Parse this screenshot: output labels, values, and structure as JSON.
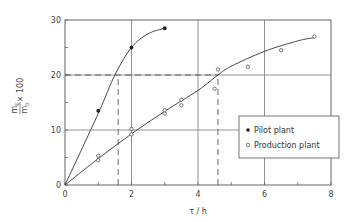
{
  "chart_data": {
    "type": "scatter",
    "title": "",
    "xlabel": "τ / h",
    "ylabel_numerator": "m_E",
    "ylabel_denominator": "m_0",
    "ylabel_suffix": "× 100",
    "ylabel": "m_E / m_0 × 100",
    "xlim": [
      0,
      8
    ],
    "ylim": [
      0,
      30
    ],
    "x_ticks": [
      0,
      2,
      4,
      6,
      8
    ],
    "y_ticks": [
      0,
      10,
      20,
      30
    ],
    "x_tick_labels": [
      "0",
      "2",
      "4",
      "6",
      "8"
    ],
    "y_tick_labels": [
      "0",
      "10",
      "20",
      "30"
    ],
    "grid": true,
    "legend_position": "right-center inside plot",
    "series": [
      {
        "name": "Pilot plant",
        "marker": "filled-circle",
        "points": [
          [
            0,
            0
          ],
          [
            1,
            13.5
          ],
          [
            2,
            25
          ],
          [
            3,
            28.5
          ]
        ],
        "curve": [
          [
            0,
            0
          ],
          [
            1,
            13
          ],
          [
            1.5,
            20
          ],
          [
            2,
            25
          ],
          [
            2.5,
            27.5
          ],
          [
            3,
            28.5
          ]
        ]
      },
      {
        "name": "Production plant",
        "marker": "open-circle",
        "points": [
          [
            0,
            0
          ],
          [
            1,
            4.5
          ],
          [
            1,
            5.3
          ],
          [
            2,
            9.2
          ],
          [
            2,
            10.2
          ],
          [
            3,
            13
          ],
          [
            3,
            13.6
          ],
          [
            3.5,
            14.5
          ],
          [
            3.5,
            15.5
          ],
          [
            4.5,
            17.5
          ],
          [
            4.6,
            21
          ],
          [
            5.5,
            21.5
          ],
          [
            6.5,
            24.5
          ],
          [
            7.5,
            27
          ]
        ],
        "curve": [
          [
            0,
            0
          ],
          [
            1,
            4.8
          ],
          [
            2,
            9.3
          ],
          [
            3,
            13.4
          ],
          [
            4,
            17.2
          ],
          [
            4.6,
            20
          ],
          [
            5,
            21.6
          ],
          [
            6,
            24.3
          ],
          [
            7,
            26.2
          ],
          [
            7.5,
            26.8
          ]
        ]
      }
    ],
    "annotations": [
      {
        "type": "dashed-horizontal",
        "y": 20,
        "x_from": 0,
        "x_to": 4.6
      },
      {
        "type": "dashed-vertical",
        "x": 1.6,
        "y_from": 0,
        "y_to": 20
      },
      {
        "type": "dashed-vertical",
        "x": 4.6,
        "y_from": 0,
        "y_to": 20
      }
    ]
  },
  "legend": {
    "items": [
      {
        "label": "Pilot plant",
        "marker": "filled-circle"
      },
      {
        "label": "Production plant",
        "marker": "open-circle"
      }
    ]
  },
  "axes": {
    "x_label": "τ / h",
    "y_label_numerator": "m",
    "y_label_numerator_sub": "E",
    "y_label_denominator": "m",
    "y_label_denominator_sub": "0",
    "y_label_suffix": "× 100",
    "x_ticks": [
      "0",
      "2",
      "4",
      "6",
      "8"
    ],
    "y_ticks": [
      "0",
      "10",
      "20",
      "30"
    ]
  }
}
